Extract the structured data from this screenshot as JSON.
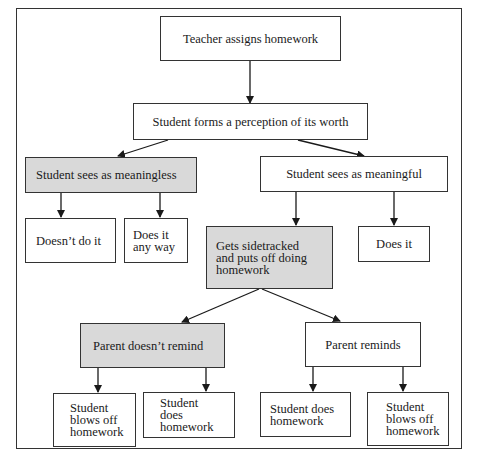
{
  "diagram": {
    "type": "flowchart",
    "nodes": {
      "teacher": {
        "label": "Teacher assigns homework",
        "shaded": false
      },
      "perception": {
        "label": "Student forms a perception of its worth",
        "shaded": false
      },
      "meaningless": {
        "label": "Student sees as meaningless",
        "shaded": true
      },
      "meaningful": {
        "label": "Student sees as meaningful",
        "shaded": false
      },
      "doesnt_do": {
        "label": "Doesn’t do it",
        "shaded": false
      },
      "does_anyway": {
        "label": "Does it\nany way",
        "shaded": false
      },
      "sidetracked": {
        "label": "Gets sidetracked\nand puts off doing\nhomework",
        "shaded": true
      },
      "does_it": {
        "label": "Does it",
        "shaded": false
      },
      "parent_no_remind": {
        "label": "Parent  doesn’t remind",
        "shaded": true
      },
      "parent_reminds": {
        "label": "Parent reminds",
        "shaded": false
      },
      "blows_off_1": {
        "label": "Student\nblows off\nhomework",
        "shaded": false
      },
      "does_hw_1": {
        "label": "Student  does\nhomework",
        "shaded": false
      },
      "does_hw_2": {
        "label": "Student  does\nhomework",
        "shaded": false
      },
      "blows_off_2": {
        "label": "Student\nblows off\nhomework",
        "shaded": false
      }
    },
    "edges": [
      [
        "teacher",
        "perception"
      ],
      [
        "perception",
        "meaningless"
      ],
      [
        "perception",
        "meaningful"
      ],
      [
        "meaningless",
        "doesnt_do"
      ],
      [
        "meaningless",
        "does_anyway"
      ],
      [
        "meaningful",
        "sidetracked"
      ],
      [
        "meaningful",
        "does_it"
      ],
      [
        "sidetracked",
        "parent_no_remind"
      ],
      [
        "sidetracked",
        "parent_reminds"
      ],
      [
        "parent_no_remind",
        "blows_off_1"
      ],
      [
        "parent_no_remind",
        "does_hw_1"
      ],
      [
        "parent_reminds",
        "does_hw_2"
      ],
      [
        "parent_reminds",
        "blows_off_2"
      ]
    ],
    "colors": {
      "shaded_fill": "#d9d9d9",
      "border": "#333333",
      "background": "#ffffff"
    }
  }
}
